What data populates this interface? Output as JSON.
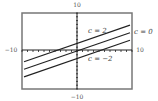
{
  "chart_data": {
    "type": "line",
    "title": "",
    "xlabel": "",
    "ylabel": "",
    "xlim": [
      -10,
      10
    ],
    "ylim": [
      -10,
      10
    ],
    "grid": false,
    "tick_labels": {
      "x_min": "−10",
      "x_max": "10",
      "y_min": "−10",
      "y_max": "10"
    },
    "series": [
      {
        "name": "c = 2",
        "equation": "y = 0.5x + 2",
        "x": [
          -10,
          10
        ],
        "y": [
          -3,
          7
        ]
      },
      {
        "name": "c = 0",
        "equation": "y = 0.5x",
        "x": [
          -10,
          10
        ],
        "y": [
          -5,
          5
        ]
      },
      {
        "name": "c = −2",
        "equation": "y = 0.5x − 2",
        "x": [
          -10,
          10
        ],
        "y": [
          -7,
          3
        ]
      }
    ],
    "annotations": [
      "c = 2",
      "c = 0",
      "c = −2"
    ]
  },
  "colors": {
    "frame": "#777777",
    "line": "#222222",
    "axis": "#222222"
  }
}
